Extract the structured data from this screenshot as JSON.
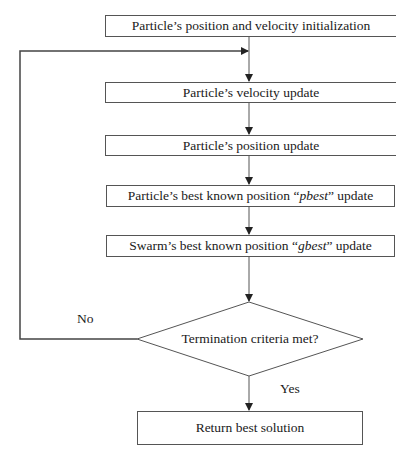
{
  "diagram": {
    "type": "flowchart",
    "nodes": [
      {
        "id": "init",
        "shape": "rect",
        "label": "Particle’s position and velocity initialization"
      },
      {
        "id": "velocity",
        "shape": "rect",
        "label": "Particle’s velocity update"
      },
      {
        "id": "position",
        "shape": "rect",
        "label": "Particle’s position update"
      },
      {
        "id": "pbest",
        "shape": "rect",
        "label_prefix": "Particle’s best known position “",
        "label_italic": "pbest",
        "label_suffix": "” update"
      },
      {
        "id": "gbest",
        "shape": "rect",
        "label_prefix": "Swarm’s best known position “",
        "label_italic": "gbest",
        "label_suffix": "” update"
      },
      {
        "id": "termination",
        "shape": "diamond",
        "label": "Termination criteria met?"
      },
      {
        "id": "return",
        "shape": "rect",
        "label": "Return best solution"
      }
    ],
    "edges": [
      {
        "from": "init",
        "to": "velocity"
      },
      {
        "from": "velocity",
        "to": "position"
      },
      {
        "from": "position",
        "to": "pbest"
      },
      {
        "from": "pbest",
        "to": "gbest"
      },
      {
        "from": "gbest",
        "to": "termination"
      },
      {
        "from": "termination",
        "to": "velocity",
        "label": "No"
      },
      {
        "from": "termination",
        "to": "return",
        "label": "Yes"
      }
    ],
    "edge_labels": {
      "no": "No",
      "yes": "Yes"
    },
    "colors": {
      "line": "#555555",
      "text": "#1a1a1a",
      "background": "#ffffff"
    }
  }
}
